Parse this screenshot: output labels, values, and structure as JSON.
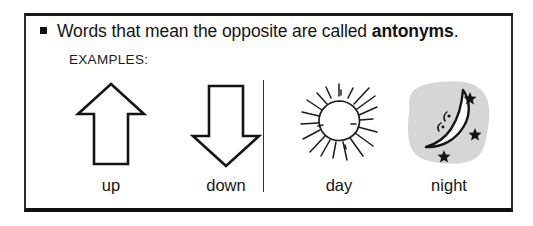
{
  "panel": {
    "bullet_icon": "square-bullet-icon",
    "headline_plain": "Words that mean the opposite are called ",
    "headline_bold": "antonyms",
    "headline_period": ".",
    "examples_label": "EXAMPLES:",
    "divider_icon": "vertical-divider"
  },
  "examples": [
    {
      "caption": "up",
      "icon": "up-arrow-icon"
    },
    {
      "caption": "down",
      "icon": "down-arrow-icon"
    },
    {
      "caption": "day",
      "icon": "sun-icon"
    },
    {
      "caption": "night",
      "icon": "crescent-moon-with-stars-icon"
    }
  ],
  "colors": {
    "ink": "#141414",
    "frame": "#1a1a1a",
    "moon_patch_gray": "#d6d6d6",
    "page_background": "#ffffff"
  }
}
